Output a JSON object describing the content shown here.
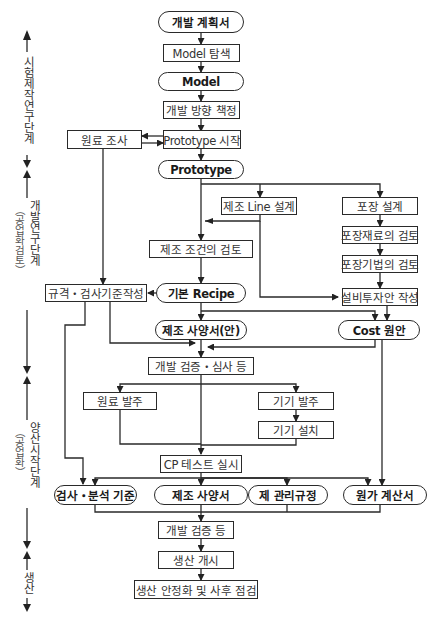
{
  "diagram": {
    "type": "flowchart",
    "stages": [
      {
        "id": "s1",
        "label": "시험제작연구단계",
        "sub": ""
      },
      {
        "id": "s2",
        "label": "개발연구단계",
        "sub": "（공업화검토）"
      },
      {
        "id": "s3",
        "label": "양산시작단계",
        "sub": "（공업화）"
      },
      {
        "id": "s4",
        "label": "생산",
        "sub": ""
      }
    ],
    "nodes": {
      "plan": "개발 계획서",
      "model_search": "Model 탐색",
      "model": "Model",
      "direction": "개발 방향 책정",
      "raw_survey": "원료 조사",
      "proto_start": "Prototype 시작",
      "prototype": "Prototype",
      "line_design": "제조 Line 설계",
      "pack_design": "포장 설계",
      "cond_review": "제조 조건의 검토",
      "pack_material": "포장재료의 검토",
      "pack_method": "포장기법의 검토",
      "spec_std": "규격・검사기준작성",
      "basic_recipe": "기본 Recipe",
      "facility_plan": "설비투자안 작성",
      "mfg_spec_draft": "제조 사양서(안)",
      "cost_draft": "Cost 원안",
      "dev_verify_review": "개발 검증・심사 등",
      "raw_order": "원료 발주",
      "equip_order": "기기 발주",
      "equip_install": "기기 설치",
      "cp_test": "CP 테스트 실시",
      "inspect_std": "검사・분석 기준",
      "mfg_spec": "제조 사양서",
      "mgmt_rules": "제 관리규정",
      "cost_calc": "원가 계산서",
      "dev_verify": "개발 검증 등",
      "prod_start": "생산 개시",
      "prod_stabilize": "생산 안정화 및 사후 점검"
    },
    "edges": [
      [
        "plan",
        "model_search"
      ],
      [
        "model_search",
        "model"
      ],
      [
        "model",
        "direction"
      ],
      [
        "direction",
        "proto_start"
      ],
      [
        "proto_start",
        "raw_survey"
      ],
      [
        "raw_survey",
        "proto_start"
      ],
      [
        "proto_start",
        "prototype"
      ],
      [
        "prototype",
        "line_design"
      ],
      [
        "prototype",
        "pack_design"
      ],
      [
        "prototype",
        "cond_review"
      ],
      [
        "line_design",
        "cond_review"
      ],
      [
        "line_design",
        "facility_plan"
      ],
      [
        "pack_design",
        "pack_material"
      ],
      [
        "pack_material",
        "pack_method"
      ],
      [
        "pack_method",
        "facility_plan"
      ],
      [
        "raw_survey",
        "spec_std"
      ],
      [
        "cond_review",
        "basic_recipe"
      ],
      [
        "basic_recipe",
        "spec_std"
      ],
      [
        "basic_recipe",
        "mfg_spec_draft"
      ],
      [
        "basic_recipe",
        "cost_draft"
      ],
      [
        "facility_plan",
        "cost_draft"
      ],
      [
        "spec_std",
        "dev_verify_review"
      ],
      [
        "mfg_spec_draft",
        "dev_verify_review"
      ],
      [
        "cost_draft",
        "dev_verify_review"
      ],
      [
        "dev_verify_review",
        "raw_order"
      ],
      [
        "dev_verify_review",
        "equip_order"
      ],
      [
        "equip_order",
        "equip_install"
      ],
      [
        "raw_order",
        "cp_test"
      ],
      [
        "equip_install",
        "cp_test"
      ],
      [
        "dev_verify_review",
        "cp_test"
      ],
      [
        "spec_std",
        "inspect_std"
      ],
      [
        "cp_test",
        "inspect_std"
      ],
      [
        "cp_test",
        "mfg_spec"
      ],
      [
        "cp_test",
        "mgmt_rules"
      ],
      [
        "cp_test",
        "cost_calc"
      ],
      [
        "cost_draft",
        "cost_calc"
      ],
      [
        "inspect_std",
        "dev_verify"
      ],
      [
        "mfg_spec",
        "dev_verify"
      ],
      [
        "mgmt_rules",
        "dev_verify"
      ],
      [
        "cost_calc",
        "dev_verify"
      ],
      [
        "dev_verify",
        "prod_start"
      ],
      [
        "prod_start",
        "prod_stabilize"
      ]
    ]
  }
}
